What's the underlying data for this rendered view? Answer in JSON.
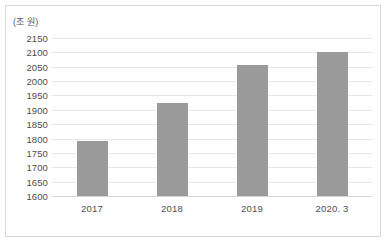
{
  "chart_data": {
    "type": "bar",
    "title": "",
    "subtitle": "",
    "unit_label": "(조 원)",
    "xlabel": "",
    "ylabel": "",
    "categories": [
      "2017",
      "2018",
      "2019",
      "2020. 3"
    ],
    "values": [
      1793,
      1925,
      2057,
      2100
    ],
    "series": [
      {
        "name": "",
        "values": [
          1793,
          1925,
          2057,
          2100
        ]
      }
    ],
    "ylim": [
      1600,
      2150
    ],
    "ytick_step": 50,
    "yticks": [
      "2150",
      "2100",
      "2050",
      "2000",
      "1950",
      "1900",
      "1850",
      "1800",
      "1750",
      "1700",
      "1650",
      "1600"
    ],
    "ytick_values": [
      2150,
      2100,
      2050,
      2000,
      1950,
      1900,
      1850,
      1800,
      1750,
      1700,
      1650,
      1600
    ],
    "grid": true,
    "grid_axis": "y",
    "legend": false,
    "legend_position": "none",
    "bar_color": "#9a9a9a",
    "grid_color": "#e6e6e6",
    "axis_color": "#d5d5d5",
    "text_color": "#4d4d4d",
    "border_color": "#d8d8d8",
    "background": "#ffffff",
    "annotations": []
  }
}
